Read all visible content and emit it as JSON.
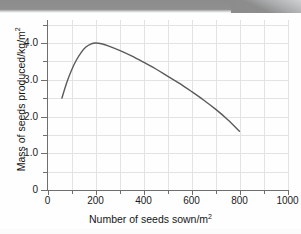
{
  "page": {
    "background_color": "#fefefe",
    "scan_band_color": "#8c8c8c"
  },
  "chart_data": {
    "type": "line",
    "title": "",
    "xlabel": "Number of seeds sown/m²",
    "ylabel": "Mass of seeds produced/kg/m²",
    "xlim": [
      0,
      1000
    ],
    "ylim": [
      0,
      4.625
    ],
    "x_ticks_major": [
      0,
      200,
      400,
      600,
      800,
      1000
    ],
    "x_tick_labels": [
      "0",
      "200",
      "400",
      "600",
      "800",
      "1000"
    ],
    "x_ticks_minor": [
      100,
      300,
      500,
      700,
      900
    ],
    "y_ticks_major": [
      0,
      1.0,
      2.0,
      3.0,
      4.0
    ],
    "y_tick_labels": [
      "0",
      "1.0",
      "2.0",
      "3.0",
      "4.0"
    ],
    "y_ticks_minor": [
      0.5,
      1.5,
      2.5,
      3.5,
      4.5
    ],
    "grid": true,
    "grid_color": "#e3e3e3",
    "legend": false,
    "line_color": "#5a5a5a",
    "line_width": 1.4,
    "series": [
      {
        "name": "Mass of seeds produced",
        "x": [
          60,
          80,
          100,
          120,
          140,
          160,
          180,
          200,
          225,
          250,
          300,
          350,
          400,
          450,
          500,
          550,
          600,
          650,
          700,
          750,
          800
        ],
        "values": [
          2.5,
          2.92,
          3.26,
          3.53,
          3.74,
          3.89,
          3.97,
          4.0,
          3.98,
          3.93,
          3.8,
          3.65,
          3.48,
          3.3,
          3.1,
          2.9,
          2.68,
          2.45,
          2.2,
          1.92,
          1.6
        ]
      }
    ],
    "annotations": {
      "peak_x": 200,
      "peak_y": 4.0,
      "start_x": 60,
      "start_y": 2.5,
      "end_x": 800,
      "end_y": 1.6
    }
  }
}
